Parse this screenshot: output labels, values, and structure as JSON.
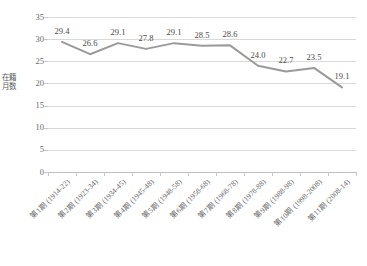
{
  "chart_data": {
    "type": "line",
    "title": "",
    "xlabel": "",
    "ylabel": "在籍月数",
    "ylim": [
      0,
      35
    ],
    "ytick_values": [
      "0",
      "5",
      "10",
      "15",
      "20",
      "25",
      "30",
      "35"
    ],
    "grid": true,
    "legend": "none",
    "categories": [
      "第1期 (1914-22)",
      "第2期 (1923-34)",
      "第3期 (1934-45)",
      "第4期 (1945-48)",
      "第5期 (1948-58)",
      "第6期 (1958-68)",
      "第7期 (1968-78)",
      "第8期 (1978-88)",
      "第9期 (1988-98)",
      "第10期 (1998-2008)",
      "第11期 (2008-14)"
    ],
    "values": [
      29.4,
      26.6,
      29.1,
      27.8,
      29.1,
      28.5,
      28.6,
      24.0,
      22.7,
      23.5,
      19.1
    ],
    "point_labels": [
      "29.4",
      "26.6",
      "29.1",
      "27.8",
      "29.1",
      "28.5",
      "28.6",
      "24.0",
      "22.7",
      "23.5",
      "19.1"
    ],
    "series_color": "#9a9a9a",
    "gridline_color": "#d9d9d9",
    "text_color": "#6b6b6b"
  }
}
